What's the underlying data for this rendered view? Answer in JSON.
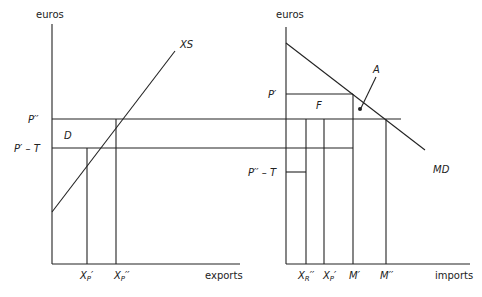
{
  "left_panel": {
    "y_axis_label": "euros",
    "x_axis_label": "exports",
    "curve_label": "XS",
    "area_label": "D",
    "price_labels": [
      "P′′",
      "P′ – T"
    ],
    "x_ticks": [
      "X",
      "X"
    ],
    "x_tick_subs": [
      "P",
      "P"
    ],
    "x_tick_primes": [
      "′",
      "′′"
    ]
  },
  "right_panel": {
    "y_axis_label": "euros",
    "x_axis_label": "imports",
    "curve_label": "MD",
    "area_labels": [
      "F",
      "A"
    ],
    "price_labels": [
      "P′",
      "P′′ – T"
    ],
    "x_ticks": [
      "X",
      "X",
      "M′",
      "M′′"
    ],
    "x_tick_subs": [
      "R",
      "P"
    ],
    "x_tick_primes": [
      "′′",
      "′"
    ]
  }
}
